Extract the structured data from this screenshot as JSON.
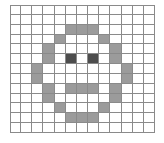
{
  "figure": {
    "type": "pixel-grid",
    "columns": 13,
    "rows": 13,
    "cell_size_px": 11.15,
    "grid_origin": {
      "x": 10,
      "y": 5
    },
    "colors": {
      "background": "#ffffff",
      "grid_line": "#8a8a8a",
      "gray_fill": "#9b9b9b",
      "dark_fill": "#4d4d4d",
      "empty": "#ffffff"
    },
    "legend": {
      "empty_label": "empty",
      "gray_label": "face outline / mouth",
      "dark_label": "eyes"
    },
    "pixels": [
      [
        "0",
        "0",
        "0",
        "0",
        "0",
        "0",
        "0",
        "0",
        "0",
        "0",
        "0",
        "0",
        "0"
      ],
      [
        "0",
        "0",
        "0",
        "0",
        "0",
        "0",
        "0",
        "0",
        "0",
        "0",
        "0",
        "0",
        "0"
      ],
      [
        "0",
        "0",
        "0",
        "0",
        "0",
        "1",
        "1",
        "1",
        "0",
        "0",
        "0",
        "0",
        "0"
      ],
      [
        "0",
        "0",
        "0",
        "0",
        "1",
        "0",
        "0",
        "0",
        "1",
        "0",
        "0",
        "0",
        "0"
      ],
      [
        "0",
        "0",
        "0",
        "1",
        "0",
        "0",
        "0",
        "0",
        "0",
        "1",
        "0",
        "0",
        "0"
      ],
      [
        "0",
        "0",
        "0",
        "1",
        "0",
        "2",
        "0",
        "2",
        "0",
        "1",
        "0",
        "0",
        "0"
      ],
      [
        "0",
        "0",
        "1",
        "0",
        "0",
        "0",
        "0",
        "0",
        "0",
        "0",
        "1",
        "0",
        "0"
      ],
      [
        "0",
        "0",
        "1",
        "0",
        "0",
        "0",
        "0",
        "0",
        "0",
        "0",
        "1",
        "0",
        "0"
      ],
      [
        "0",
        "0",
        "0",
        "1",
        "0",
        "1",
        "1",
        "1",
        "0",
        "1",
        "0",
        "0",
        "0"
      ],
      [
        "0",
        "0",
        "0",
        "1",
        "0",
        "0",
        "0",
        "0",
        "0",
        "1",
        "0",
        "0",
        "0"
      ],
      [
        "0",
        "0",
        "0",
        "0",
        "1",
        "0",
        "0",
        "0",
        "1",
        "0",
        "0",
        "0",
        "0"
      ],
      [
        "0",
        "0",
        "0",
        "0",
        "0",
        "1",
        "1",
        "1",
        "0",
        "0",
        "0",
        "0",
        "0"
      ],
      [
        "0",
        "0",
        "0",
        "0",
        "0",
        "0",
        "0",
        "0",
        "0",
        "0",
        "0",
        "0",
        "0"
      ]
    ]
  }
}
